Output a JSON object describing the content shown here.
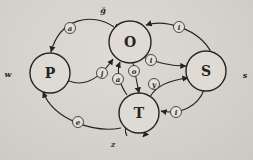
{
  "figure": {
    "type": "state-transition-diagram",
    "colors": {
      "paper": "#d5d2cb",
      "ink": "#26241f",
      "node_fill": "#dedbd4",
      "badge_fill": "#e3e0d9"
    },
    "nodes": [
      {
        "id": "P",
        "label": "P",
        "x": 50,
        "y": 73,
        "r": 20,
        "loop": {
          "path": "M 34,63 A 10,10 0 1 1 34,82",
          "label": "w",
          "lx": 8,
          "ly": 77
        }
      },
      {
        "id": "O",
        "label": "O",
        "x": 130,
        "y": 42,
        "r": 21,
        "loop": {
          "path": "M 117,24 A 11,11 0 1 0 133,22",
          "label": "ğ",
          "lx": 103,
          "ly": 13
        }
      },
      {
        "id": "S",
        "label": "S",
        "x": 206,
        "y": 71,
        "r": 20,
        "loop": {
          "path": "M 221,65 A 9,9 0 1 0 221,77",
          "label": "s",
          "lx": 245,
          "ly": 78
        }
      },
      {
        "id": "T",
        "label": "T",
        "x": 139,
        "y": 113,
        "r": 20,
        "loop": {
          "path": "M 127,136 A 10,10 0 1 1 143,137",
          "label": "z",
          "lx": 113,
          "ly": 147
        }
      }
    ],
    "edges": [
      {
        "id": "O-P",
        "from": "O",
        "to": "P",
        "label": "a",
        "path": "M 114,27 C 92,12 60,18 51,52",
        "lx": 70,
        "ly": 28
      },
      {
        "id": "P-O",
        "from": "P",
        "to": "O",
        "label": "j",
        "path": "M 69,81 C 87,88 102,75 113,59",
        "lx": 102,
        "ly": 73
      },
      {
        "id": "S-O",
        "from": "S",
        "to": "O",
        "label": "i",
        "path": "M 211,52 C 199,29 165,19 146,25",
        "lx": 179,
        "ly": 27
      },
      {
        "id": "O-S",
        "from": "O",
        "to": "S",
        "label": "i",
        "path": "M 143,57 C 157,63 173,66 186,66",
        "lx": 151,
        "ly": 60
      },
      {
        "id": "O-T",
        "from": "O",
        "to": "T",
        "label": "o",
        "path": "M 133,63 C 135,72 137,83 139,93",
        "lx": 134,
        "ly": 71
      },
      {
        "id": "T-O",
        "from": "T",
        "to": "O",
        "label": "a",
        "path": "M 127,95 C 120,85 116,72 120,62",
        "lx": 118,
        "ly": 79
      },
      {
        "id": "T-S",
        "from": "T",
        "to": "S",
        "label": "y",
        "path": "M 150,97 C 156,86 170,80 188,78",
        "lx": 154,
        "ly": 84
      },
      {
        "id": "S-T",
        "from": "S",
        "to": "T",
        "label": "i",
        "path": "M 204,90 C 198,106 181,115 161,111",
        "lx": 176,
        "ly": 112
      },
      {
        "id": "T-P",
        "from": "T",
        "to": "P",
        "label": "e",
        "path": "M 121,128 C 94,133 54,120 43,92",
        "lx": 78,
        "ly": 122
      }
    ]
  }
}
